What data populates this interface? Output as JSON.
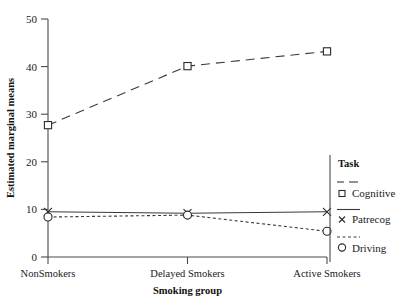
{
  "chart_data": {
    "type": "line",
    "title": "",
    "xlabel": "Smoking group",
    "ylabel": "Estimated marginal means",
    "categories": [
      "NonSmokers",
      "Delayed Smokers",
      "Active Smokers"
    ],
    "ylim": [
      0,
      50
    ],
    "yticks": [
      0,
      10,
      20,
      30,
      40,
      50
    ],
    "ytick_labels": [
      "0",
      "10",
      "20",
      "30",
      "40",
      "50"
    ],
    "grid": false,
    "legend_position": "right",
    "legend_title": "Task",
    "series": [
      {
        "name": "Cognitive",
        "values": [
          27.7,
          40.1,
          43.2
        ],
        "marker": "square",
        "linestyle": "dashed",
        "color": "#2b2b2b"
      },
      {
        "name": "Patrecog",
        "values": [
          9.5,
          9.2,
          9.5
        ],
        "marker": "cross",
        "linestyle": "solid",
        "color": "#2b2b2b"
      },
      {
        "name": "Driving",
        "values": [
          8.4,
          8.8,
          5.4
        ],
        "marker": "circle",
        "linestyle": "dotted",
        "color": "#2b2b2b"
      }
    ]
  },
  "axes": {
    "y_title": "Estimated marginal means",
    "x_title": "Smoking group",
    "y_tick_50": "50",
    "y_tick_40": "40",
    "y_tick_30": "30",
    "y_tick_20": "20",
    "y_tick_10": "10",
    "y_tick_0": "0",
    "x_cat_0": "NonSmokers",
    "x_cat_1": "Delayed Smokers",
    "x_cat_2": "Active Smokers"
  },
  "legend": {
    "title": "Task",
    "item_0_label": "Cognitive",
    "item_1_label": "Patrecog",
    "item_2_label": "Driving"
  },
  "colors": {
    "axis": "#4a4a4a",
    "line": "#3a3a3a",
    "marker": "#2b2b2b",
    "text": "#1a1a1a",
    "background": "#ffffff"
  }
}
